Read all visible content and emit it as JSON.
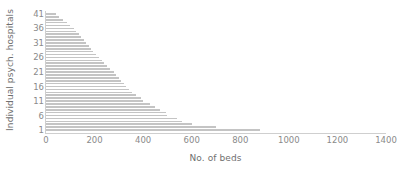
{
  "chart_data": {
    "type": "bar",
    "orientation": "horizontal",
    "title": "",
    "xlabel": "No. of beds",
    "ylabel": "Individual psych. hospitals",
    "xlim": [
      0,
      1400
    ],
    "ylim": [
      0,
      42
    ],
    "grid": false,
    "legend": null,
    "bar_color": "#c4c4c4",
    "axis_color": "#cfcfcf",
    "tick_label_color": "#8a8a8a",
    "axis_label_color": "#6f6f6f",
    "xticks": [
      0,
      200,
      400,
      600,
      800,
      1000,
      1200,
      1400
    ],
    "yticks": [
      1,
      6,
      11,
      16,
      21,
      26,
      31,
      36,
      41
    ],
    "categories": [
      1,
      2,
      3,
      4,
      5,
      6,
      7,
      8,
      9,
      10,
      11,
      12,
      13,
      14,
      15,
      16,
      17,
      18,
      19,
      20,
      21,
      22,
      23,
      24,
      25,
      26,
      27,
      28,
      29,
      30,
      31,
      32,
      33,
      34,
      35,
      36,
      37,
      38,
      39,
      40,
      41
    ],
    "values": [
      880,
      700,
      600,
      560,
      540,
      500,
      495,
      470,
      450,
      430,
      400,
      390,
      370,
      355,
      340,
      330,
      320,
      310,
      300,
      290,
      280,
      265,
      250,
      240,
      230,
      220,
      205,
      195,
      185,
      175,
      165,
      155,
      145,
      135,
      125,
      115,
      100,
      85,
      70,
      55,
      40
    ]
  }
}
